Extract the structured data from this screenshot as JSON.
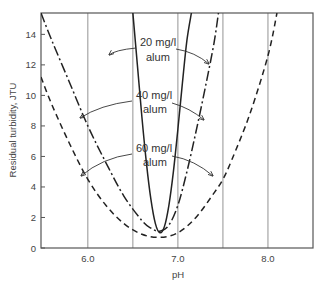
{
  "chart_data": {
    "type": "line",
    "title": "",
    "xlabel": "pH",
    "ylabel": "Residual turbidity, JTU",
    "xlim": [
      5.48,
      8.5
    ],
    "ylim": [
      0,
      15.4
    ],
    "x_ticks": [
      6.0,
      7.0,
      8.0
    ],
    "x_tick_labels": [
      "6.0",
      "7.0",
      "8.0"
    ],
    "y_ticks": [
      0,
      2,
      4,
      6,
      8,
      10,
      12,
      14
    ],
    "y_tick_labels": [
      "0",
      "2",
      "4",
      "6",
      "8",
      "10",
      "12",
      "14"
    ],
    "vertical_gridlines": [
      6.0,
      6.5,
      7.0,
      7.5,
      8.0
    ],
    "grid": "vertical only",
    "legend": "none (inline annotations with arrows)",
    "series": [
      {
        "name": "20 mg/l alum",
        "style": "solid",
        "x": [
          6.5,
          6.55,
          6.6,
          6.65,
          6.7,
          6.75,
          6.8,
          6.85,
          6.9,
          6.95,
          7.0,
          7.05,
          7.1,
          7.15
        ],
        "y": [
          15.4,
          12.0,
          8.6,
          5.6,
          3.2,
          1.6,
          1.0,
          1.4,
          2.8,
          5.0,
          7.8,
          10.8,
          13.6,
          15.4
        ]
      },
      {
        "name": "40 mg/l alum",
        "style": "dash-dot",
        "x": [
          5.48,
          5.6,
          5.8,
          6.0,
          6.2,
          6.4,
          6.6,
          6.7,
          6.8,
          6.9,
          7.0,
          7.1,
          7.2,
          7.3,
          7.4,
          7.45
        ],
        "y": [
          15.4,
          13.6,
          10.8,
          8.0,
          5.6,
          3.4,
          1.8,
          1.3,
          1.1,
          1.5,
          2.8,
          5.0,
          7.6,
          10.4,
          13.4,
          15.4
        ]
      },
      {
        "name": "60 mg/l alum",
        "style": "dashed",
        "x": [
          5.48,
          5.6,
          5.8,
          6.0,
          6.2,
          6.4,
          6.6,
          6.8,
          7.0,
          7.2,
          7.4,
          7.5,
          7.6,
          7.8,
          8.0,
          8.1
        ],
        "y": [
          11.2,
          9.4,
          6.8,
          4.5,
          2.8,
          1.6,
          0.9,
          0.7,
          1.0,
          2.0,
          3.6,
          4.5,
          5.8,
          8.8,
          12.6,
          15.4
        ]
      }
    ],
    "annotations": [
      {
        "line1": "20 mg/l",
        "line2": "alum",
        "points_to": "20 mg/l curve (both branches)"
      },
      {
        "line1": "40 mg/l",
        "line2": "alum",
        "points_to": "40 mg/l curve (both branches)"
      },
      {
        "line1": "60 mg/l",
        "line2": "alum",
        "points_to": "60 mg/l curve (both branches)"
      }
    ]
  }
}
